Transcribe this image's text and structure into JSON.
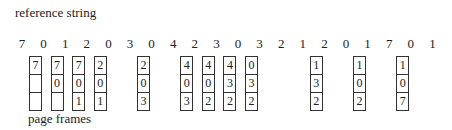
{
  "title": "reference string",
  "footer": "page frames",
  "reference_string": [
    "7",
    "0",
    "1",
    "2",
    "0",
    "3",
    "0",
    "4",
    "2",
    "3",
    "0",
    "3",
    "2",
    "1",
    "2",
    "0",
    "1",
    "7",
    "0",
    "1"
  ],
  "frames": [
    {
      "ref_index": 0,
      "pages": [
        "7",
        "",
        ""
      ]
    },
    {
      "ref_index": 1,
      "pages": [
        "7",
        "0",
        ""
      ]
    },
    {
      "ref_index": 2,
      "pages": [
        "7",
        "0",
        "1"
      ]
    },
    {
      "ref_index": 3,
      "pages": [
        "2",
        "0",
        "1"
      ]
    },
    {
      "ref_index": 5,
      "pages": [
        "2",
        "0",
        "3"
      ]
    },
    {
      "ref_index": 7,
      "pages": [
        "4",
        "0",
        "3"
      ]
    },
    {
      "ref_index": 8,
      "pages": [
        "4",
        "0",
        "2"
      ]
    },
    {
      "ref_index": 9,
      "pages": [
        "4",
        "3",
        "2"
      ]
    },
    {
      "ref_index": 10,
      "pages": [
        "0",
        "3",
        "2"
      ]
    },
    {
      "ref_index": 13,
      "pages": [
        "1",
        "3",
        "2"
      ]
    },
    {
      "ref_index": 15,
      "pages": [
        "1",
        "0",
        "2"
      ]
    },
    {
      "ref_index": 17,
      "pages": [
        "1",
        "0",
        "7"
      ]
    }
  ]
}
